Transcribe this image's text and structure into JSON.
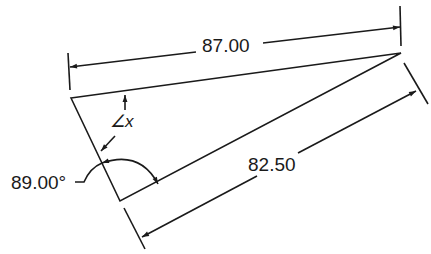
{
  "diagram": {
    "type": "engineering-dimensioned-triangle",
    "stroke_color": "#1a1a1a",
    "background": "#ffffff",
    "shape": {
      "name": "triangle",
      "vertices": [
        [
          71,
          98
        ],
        [
          401,
          53
        ],
        [
          120,
          201
        ]
      ]
    },
    "dimensions": {
      "top_length": {
        "label": "87.00"
      },
      "bottom_length": {
        "label": "82.50"
      },
      "corner_angle": {
        "label": "89.00°"
      },
      "unknown_angle": {
        "label": "∠x"
      }
    }
  }
}
